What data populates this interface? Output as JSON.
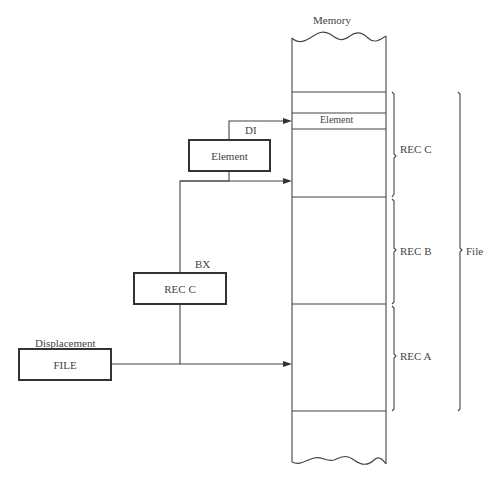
{
  "diagram": {
    "memory_title": "Memory",
    "memory_element_label": "Element",
    "braces": {
      "rec_c": "REC C",
      "rec_b": "REC B",
      "rec_a": "REC A",
      "file": "File"
    },
    "registers": {
      "di_label": "DI",
      "di_box": "Element",
      "bx_label": "BX",
      "bx_box": "REC C",
      "displacement_label": "Displacement",
      "displacement_box": "FILE"
    }
  }
}
